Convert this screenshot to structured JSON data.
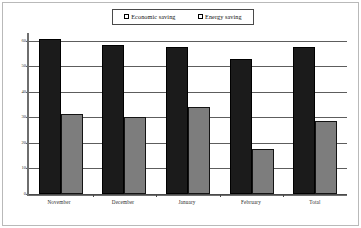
{
  "chart_data": {
    "type": "bar",
    "title": "",
    "subtitle": "",
    "xlabel": "",
    "ylabel": "",
    "categories": [
      "November",
      "December",
      "January",
      "February",
      "Total"
    ],
    "series": [
      {
        "name": "Economic saving",
        "color": "#1b1b1b",
        "values": [
          60.5,
          58.5,
          57.5,
          53.0,
          57.5
        ]
      },
      {
        "name": "Energy saving",
        "color": "#7d7d7d",
        "values": [
          31.5,
          30.0,
          34.0,
          17.5,
          28.5
        ]
      }
    ],
    "ylim": [
      0,
      63
    ],
    "yticks": [
      0,
      10,
      20,
      30,
      40,
      50,
      60
    ],
    "ytick_labels": [
      "0",
      "10",
      "20",
      "30",
      "40",
      "50",
      "60"
    ],
    "grid": "horizontal",
    "legend_position": "top-center",
    "legend_entries": [
      {
        "label": "Economic saving",
        "marker": "square",
        "color": "#1b1b1b"
      },
      {
        "label": "Energy saving",
        "marker": "square",
        "color": "#7d7d7d"
      }
    ]
  }
}
